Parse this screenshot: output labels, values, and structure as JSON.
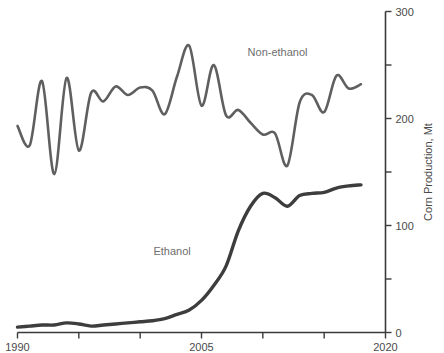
{
  "chart_data": {
    "type": "line",
    "title": "",
    "subtitle": "",
    "xlabel": "",
    "ylabel": "Corn Production, Mt",
    "xlim": [
      1990,
      2020
    ],
    "ylim": [
      0,
      300
    ],
    "grid": false,
    "legend_position": "inline-annotation",
    "y_axis_side": "right",
    "x_tick_values": [
      1990,
      1995,
      2000,
      2005,
      2010,
      2015,
      2020
    ],
    "x_tick_labels": [
      "1990",
      "",
      "",
      "2005",
      "",
      "",
      "2020"
    ],
    "y_tick_values": [
      0,
      50,
      100,
      150,
      200,
      250,
      300
    ],
    "y_tick_labels": [
      "0",
      "",
      "100",
      "",
      "200",
      "",
      "300"
    ],
    "x": [
      1990,
      1991,
      1992,
      1993,
      1994,
      1995,
      1996,
      1997,
      1998,
      1999,
      2000,
      2001,
      2002,
      2003,
      2004,
      2005,
      2006,
      2007,
      2008,
      2009,
      2010,
      2011,
      2012,
      2013,
      2014,
      2015,
      2016,
      2017,
      2018
    ],
    "series": [
      {
        "name": "Non-ethanol",
        "color": "#5f5f5f",
        "label_x": 2011.2,
        "label_y": 258,
        "values": [
          193,
          175,
          235,
          148,
          238,
          170,
          224,
          216,
          230,
          222,
          229,
          226,
          204,
          239,
          268,
          212,
          250,
          203,
          208,
          196,
          185,
          186,
          156,
          215,
          222,
          206,
          240,
          228,
          232
        ]
      },
      {
        "name": "Ethanol",
        "color": "#3d3d3d",
        "label_x": 2002.6,
        "label_y": 72,
        "values": [
          5,
          6,
          7,
          7,
          9,
          8,
          6,
          7,
          8,
          9,
          10,
          11,
          13,
          17,
          21,
          30,
          44,
          62,
          95,
          118,
          130,
          126,
          118,
          128,
          130,
          131,
          135,
          137,
          138
        ]
      }
    ]
  }
}
